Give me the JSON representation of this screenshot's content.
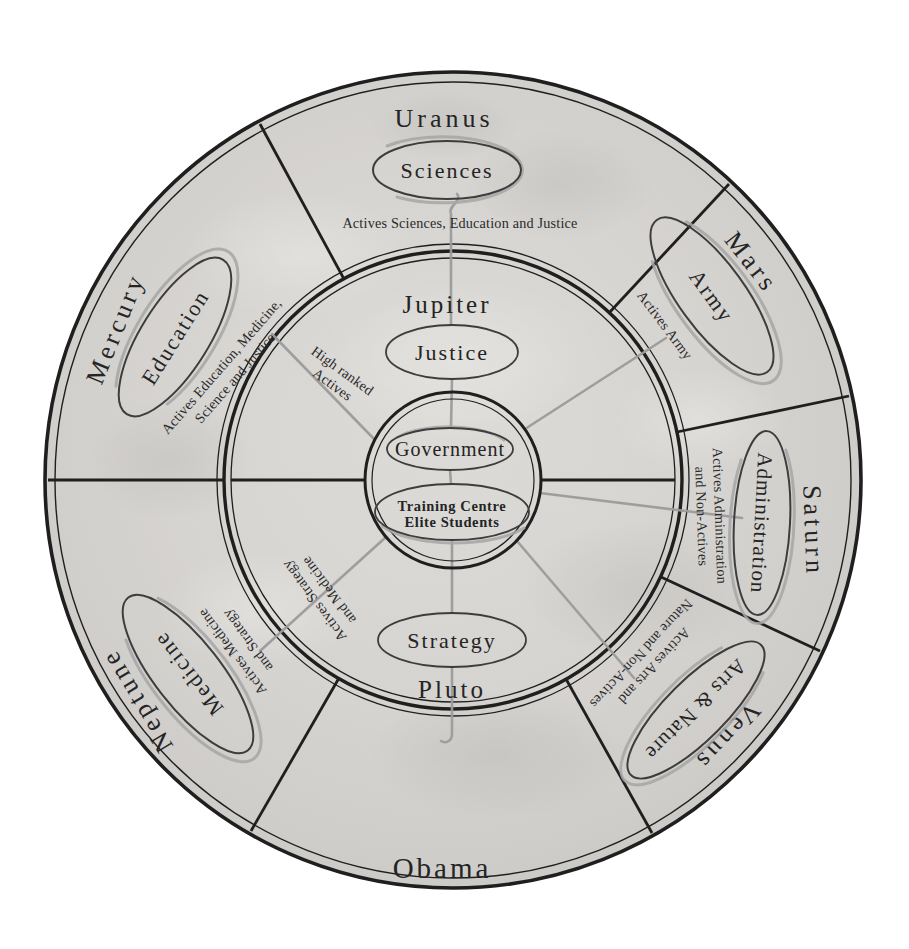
{
  "diagram": {
    "center": {
      "government": "Government",
      "training_line1": "Training Centre",
      "training_line2": "Elite Students"
    },
    "inner_ring": {
      "top_planet": "Jupiter",
      "top_dept": "Justice",
      "bottom_planet": "Pluto",
      "bottom_dept": "Strategy",
      "high_ranked_line1": "High ranked",
      "high_ranked_line2": "Actives",
      "strategy_medicine_line1": "Actives Strategy",
      "strategy_medicine_line2": "and Medicine"
    },
    "sectors": {
      "uranus": {
        "planet": "Uranus",
        "dept": "Sciences",
        "note": "Actives Sciences, Education and Justice"
      },
      "mars": {
        "planet": "Mars",
        "dept": "Army",
        "note": "Actives Army"
      },
      "saturn": {
        "planet": "Saturn",
        "dept": "Administration",
        "note_line1": "Actives Administration",
        "note_line2": "and Non-Actives"
      },
      "venus": {
        "planet": "Venus",
        "dept": "Arts & Nature",
        "note_line1": "Actives Arts and",
        "note_line2": "Nature and Non-Actives"
      },
      "obama": {
        "planet": "Obama"
      },
      "neptune": {
        "planet": "Neptune",
        "dept": "Medicine",
        "note_line1": "Actives Medicine",
        "note_line2": "and Strategy"
      },
      "mercury": {
        "planet": "Mercury",
        "dept": "Education",
        "note_line1": "Actives Education, Medicine,",
        "note_line2": "Science and Justice"
      }
    },
    "colors": {
      "paper": "#d6d4d1",
      "ink": "#1f1f1f",
      "ellipse_stroke": "#3d3d3d",
      "connector_gray": "#9b9b9b",
      "swoosh_gray": "#a6a6a6"
    }
  }
}
